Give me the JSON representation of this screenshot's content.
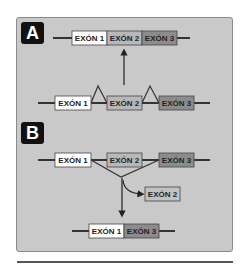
{
  "panels": {
    "a": {
      "badge": "A"
    },
    "b": {
      "badge": "B"
    }
  },
  "exons": {
    "e1": "EXÓN 1",
    "e2": "EXÓN 2",
    "e3": "EXÓN 3"
  },
  "colors": {
    "panel_bg": "#c9c9c9",
    "exon1": "#ffffff",
    "exon2": "#b8b8b8",
    "exon3": "#8c8c8c",
    "line": "#333333"
  }
}
